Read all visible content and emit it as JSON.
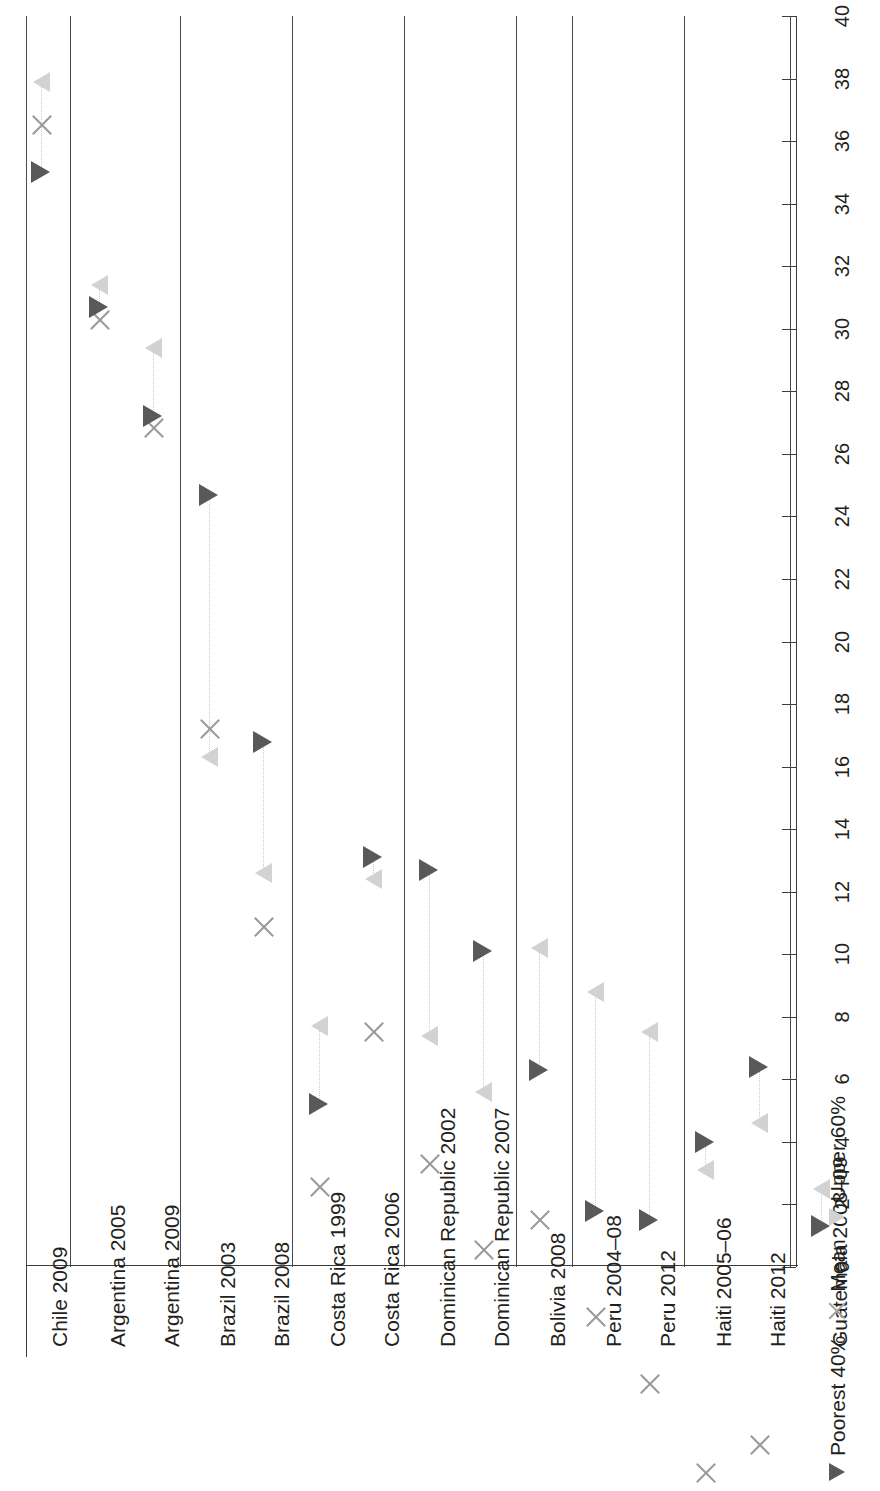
{
  "chart_data": {
    "type": "scatter",
    "title": "",
    "xlabel": "",
    "ylabel": "",
    "orientation": "rotated-90",
    "grid": false,
    "axis": {
      "min": 0,
      "max": 40,
      "step": 2,
      "ticks": [
        "0",
        "2",
        "4",
        "6",
        "8",
        "10",
        "12",
        "14",
        "16",
        "18",
        "20",
        "22",
        "24",
        "26",
        "28",
        "30",
        "32",
        "34",
        "36",
        "38",
        "40"
      ]
    },
    "legend": {
      "position": "bottom-right",
      "entries": [
        {
          "label": "Poorest 40%",
          "marker": "triangle-dark",
          "color": "#595959"
        },
        {
          "label": "Mean",
          "marker": "x",
          "color": "#9a9a9a"
        },
        {
          "label": "Upper 60%",
          "marker": "triangle-light",
          "color": "#d2d2d2"
        }
      ]
    },
    "series": [
      {
        "name": "Poorest 40%",
        "marker": "triangle-dark",
        "color": "#595959"
      },
      {
        "name": "Mean",
        "marker": "x",
        "color": "#9a9a9a"
      },
      {
        "name": "Upper 60%",
        "marker": "triangle-light",
        "color": "#d2d2d2"
      }
    ],
    "categories": [
      "Chile 2009",
      "Argentina 2005",
      "Argentina 2009",
      "Brazil 2003",
      "Brazil 2008",
      "Costa Rica 1999",
      "Costa Rica 2006",
      "Dominican Republic 2002",
      "Dominican Republic 2007",
      "Bolivia 2008",
      "Peru 2004–08",
      "Peru 2012",
      "Haiti 2005–06",
      "Haiti 2012",
      "Guatemala 2008–09"
    ],
    "groups": [
      {
        "name": "Chile",
        "categories": [
          "Chile 2009"
        ]
      },
      {
        "name": "Argentina",
        "categories": [
          "Argentina 2005",
          "Argentina 2009"
        ]
      },
      {
        "name": "Brazil",
        "categories": [
          "Brazil 2003",
          "Brazil 2008"
        ]
      },
      {
        "name": "Costa Rica",
        "categories": [
          "Costa Rica 1999",
          "Costa Rica 2006"
        ]
      },
      {
        "name": "Dominican Republic",
        "categories": [
          "Dominican Republic 2002",
          "Dominican Republic 2007"
        ]
      },
      {
        "name": "Bolivia",
        "categories": [
          "Bolivia 2008"
        ]
      },
      {
        "name": "Peru",
        "categories": [
          "Peru 2004–08",
          "Peru 2012"
        ]
      },
      {
        "name": "Haiti",
        "categories": [
          "Haiti 2005–06",
          "Haiti 2012"
        ]
      },
      {
        "name": "Guatemala",
        "categories": [
          "Guatemala 2008–09"
        ]
      }
    ],
    "points": [
      {
        "category": "Chile 2009",
        "poorest40": 35.0,
        "mean": 36.5,
        "upper60": 37.9
      },
      {
        "category": "Argentina 2005",
        "poorest40": 30.7,
        "mean": 31.1,
        "upper60": 31.4
      },
      {
        "category": "Argentina 2009",
        "poorest40": 27.2,
        "mean": 28.5,
        "upper60": 29.4
      },
      {
        "category": "Brazil 2003",
        "poorest40": 24.7,
        "mean": 19.7,
        "upper60": 16.3
      },
      {
        "category": "Brazil 2008",
        "poorest40": 16.8,
        "mean": 14.2,
        "upper60": 12.6
      },
      {
        "category": "Costa Rica 1999",
        "poorest40": 5.2,
        "mean": 6.7,
        "upper60": 7.7
      },
      {
        "category": "Costa Rica 2006",
        "poorest40": 13.1,
        "mean": 12.5,
        "upper60": 12.4
      },
      {
        "category": "Dominican Republic 2002",
        "poorest40": 12.7,
        "mean": 9.1,
        "upper60": 7.4
      },
      {
        "category": "Dominican Republic 2007",
        "poorest40": 10.1,
        "mean": 7.2,
        "upper60": 5.6
      },
      {
        "category": "Bolivia 2008",
        "poorest40": 6.3,
        "mean": 9.0,
        "upper60": 10.2
      },
      {
        "category": "Peru 2004–08",
        "poorest40": 1.8,
        "mean": 6.7,
        "upper60": 8.8
      },
      {
        "category": "Peru 2012",
        "poorest40": 1.5,
        "mean": 5.4,
        "upper60": 7.5
      },
      {
        "category": "Haiti 2005–06",
        "poorest40": 4.0,
        "mean": 3.4,
        "upper60": 3.1
      },
      {
        "category": "Haiti 2012",
        "poorest40": 6.4,
        "mean": 5.1,
        "upper60": 4.6
      },
      {
        "category": "Guatemala 2008–09",
        "poorest40": 1.3,
        "mean": 1.9,
        "upper60": 2.5
      }
    ]
  },
  "layout": {
    "category_slots": [
      {
        "category": "Chile 2009",
        "center": 40,
        "group_start": true
      },
      {
        "category": "Argentina 2005",
        "center": 98,
        "group_start": true
      },
      {
        "category": "Argentina 2009",
        "center": 152,
        "group_start": false
      },
      {
        "category": "Brazil 2003",
        "center": 208,
        "group_start": true
      },
      {
        "category": "Brazil 2008",
        "center": 262,
        "group_start": false
      },
      {
        "category": "Costa Rica 1999",
        "center": 318,
        "group_start": true
      },
      {
        "category": "Costa Rica 2006",
        "center": 372,
        "group_start": false
      },
      {
        "category": "Dominican Republic 2002",
        "center": 428,
        "group_start": true
      },
      {
        "category": "Dominican Republic 2007",
        "center": 482,
        "group_start": false
      },
      {
        "category": "Bolivia 2008",
        "center": 538,
        "group_start": true
      },
      {
        "category": "Peru 2004–08",
        "center": 594,
        "group_start": true
      },
      {
        "category": "Peru 2012",
        "center": 648,
        "group_start": false
      },
      {
        "category": "Haiti 2005–06",
        "center": 704,
        "group_start": true
      },
      {
        "category": "Haiti 2012",
        "center": 758,
        "group_start": false
      },
      {
        "category": "Guatemala 2008–09",
        "center": 820,
        "group_start": true
      }
    ],
    "group_divider_x": [
      26,
      70,
      180,
      292,
      404,
      516,
      572,
      684,
      790
    ],
    "thin_divider_x": []
  }
}
